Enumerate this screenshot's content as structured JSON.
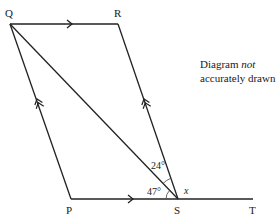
{
  "diagram": {
    "points": {
      "Q": {
        "label": "Q",
        "x": 10,
        "y": 24
      },
      "R": {
        "label": "R",
        "x": 118,
        "y": 24
      },
      "P": {
        "label": "P",
        "x": 71,
        "y": 199
      },
      "S": {
        "label": "S",
        "x": 178,
        "y": 199
      },
      "T": {
        "label": "T",
        "x": 253,
        "y": 199
      }
    },
    "angles": {
      "QSR": "24°",
      "PSQ": "47°",
      "RST": "x"
    },
    "note": {
      "line1": "Diagram ",
      "italic": "not",
      "line2": "accurately drawn"
    },
    "segments": [
      "QR",
      "RS",
      "QP",
      "PS",
      "QS",
      "ST"
    ],
    "parallel_marks": {
      "single_arrow": [
        "QR",
        "PS"
      ],
      "double_arrow": [
        "QP",
        "RS"
      ]
    }
  }
}
